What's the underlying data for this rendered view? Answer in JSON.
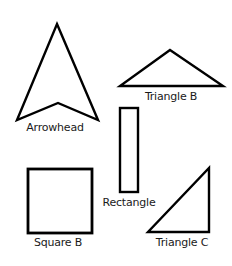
{
  "diagram": {
    "stroke_color": "#000000",
    "background": "#ffffff",
    "shapes": [
      {
        "id": "arrowhead",
        "type": "arrowhead",
        "label": "Arrowhead",
        "points": [
          [
            57,
            24
          ],
          [
            98,
            120
          ],
          [
            58,
            103
          ],
          [
            17,
            120
          ]
        ],
        "label_pos": [
          55,
          131
        ]
      },
      {
        "id": "triangle-b",
        "type": "triangle",
        "label": "Triangle B",
        "points": [
          [
            170,
            50
          ],
          [
            223,
            86
          ],
          [
            120,
            86
          ]
        ],
        "label_pos": [
          171,
          100
        ]
      },
      {
        "id": "rectangle",
        "type": "rectangle",
        "label": "Rectangle",
        "rect": [
          120,
          108,
          18,
          84
        ],
        "label_pos": [
          128,
          206
        ]
      },
      {
        "id": "square-b",
        "type": "square",
        "label": "Square B",
        "rect": [
          28,
          169,
          64,
          64
        ],
        "label_pos": [
          58,
          244
        ]
      },
      {
        "id": "triangle-c",
        "type": "triangle",
        "label": "Triangle C",
        "points": [
          [
            209,
            168
          ],
          [
            209,
            232
          ],
          [
            148,
            232
          ]
        ],
        "label_pos": [
          182,
          245
        ]
      }
    ]
  }
}
